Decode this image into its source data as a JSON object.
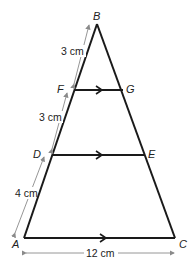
{
  "diagram": {
    "type": "triangle-with-parallel-segments",
    "vertices": {
      "A": {
        "label": "A",
        "x": 24,
        "y": 238
      },
      "B": {
        "label": "B",
        "x": 97,
        "y": 24
      },
      "C": {
        "label": "C",
        "x": 175,
        "y": 238
      },
      "D": {
        "label": "D",
        "x": 53,
        "y": 155
      },
      "E": {
        "label": "E",
        "x": 144,
        "y": 155
      },
      "F": {
        "label": "F",
        "x": 75,
        "y": 90
      },
      "G": {
        "label": "G",
        "x": 123,
        "y": 90
      }
    },
    "measurements": {
      "BF": "3 cm",
      "FD": "3 cm",
      "DA": "4 cm",
      "AC": "12 cm"
    },
    "parallel_segments": [
      "FG",
      "DE",
      "AC"
    ],
    "colors": {
      "line": "#1a1a1a",
      "dimension": "#8a8a8a"
    }
  }
}
